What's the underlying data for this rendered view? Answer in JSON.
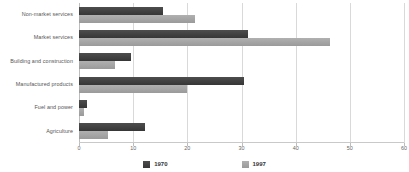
{
  "chart_data": {
    "type": "bar",
    "orientation": "horizontal",
    "title": "",
    "subtitle": "",
    "xlabel": "",
    "ylabel": "",
    "xlim": [
      0,
      60
    ],
    "xticks": [
      0,
      10,
      20,
      30,
      40,
      50,
      60
    ],
    "xticklabels": [
      "0",
      "10",
      "20",
      "30",
      "40",
      "50",
      "60"
    ],
    "grid": true,
    "grid_axis": "x",
    "legend_position": "bottom",
    "categories": [
      "Non-market services",
      "Market services",
      "Building and construction",
      "Manufactured products",
      "Fuel and power",
      "Agriculture"
    ],
    "series": [
      {
        "name": "1970",
        "color": "#3f3f3f",
        "values": [
          15.5,
          31.2,
          9.6,
          30.4,
          1.5,
          12.2
        ]
      },
      {
        "name": "1997",
        "color": "#a3a3a3",
        "values": [
          21.5,
          46.3,
          6.6,
          19.9,
          1.0,
          5.3
        ]
      }
    ]
  },
  "legend": {
    "entries": [
      {
        "label": "1970",
        "swatch": "series-1970-swatch"
      },
      {
        "label": "1997",
        "swatch": "series-1997-swatch"
      }
    ]
  }
}
